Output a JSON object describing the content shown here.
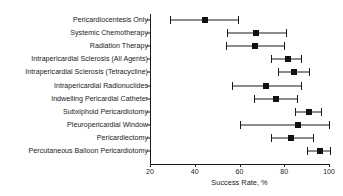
{
  "chart_data": {
    "type": "scatter",
    "subtype": "forest-plot",
    "title": "",
    "xlabel": "Success Rate, %",
    "ylabel": "",
    "xlim": [
      20,
      100
    ],
    "xticks": [
      20,
      40,
      60,
      80,
      100
    ],
    "xticklabels": [
      "20",
      "40",
      "60",
      "80",
      "100"
    ],
    "grid": false,
    "legend": false,
    "marker_style": "filled-square",
    "marker_color": "#111111",
    "line_color": "#1a1a1a",
    "error_bar_style": "capped-horizontal",
    "categories": [
      "Pericardiocentesis Only",
      "Systemic Chemotherapy",
      "Radiation Therapy",
      "Intrapericardial Sclerosis (All Agents)",
      "Intrapericardial Sclerosis (Tetracycline)",
      "Intrapericardial Radionuclides",
      "Indwelling Pericardial Catheter",
      "Subxiphoid Pericardiotomy",
      "Pleuropericardial Window",
      "Pericardiectomy",
      "Percutaneous Balloon Pericardiotomy"
    ],
    "points": [
      {
        "label": "Pericardiocentesis Only",
        "value": 44.5,
        "low": 29.0,
        "high": 59.5
      },
      {
        "label": "Systemic Chemotherapy",
        "value": 67.5,
        "low": 54.5,
        "high": 81.0
      },
      {
        "label": "Radiation Therapy",
        "value": 67.0,
        "low": 54.0,
        "high": 80.0
      },
      {
        "label": "Intrapericardial Sclerosis (All Agents)",
        "value": 81.5,
        "low": 74.0,
        "high": 87.5
      },
      {
        "label": "Intrapericardial Sclerosis (Tetracycline)",
        "value": 84.5,
        "low": 77.0,
        "high": 91.0
      },
      {
        "label": "Intrapericardial Radionuclides",
        "value": 72.0,
        "low": 56.5,
        "high": 87.5
      },
      {
        "label": "Indwelling Pericardial Catheter",
        "value": 76.5,
        "low": 66.5,
        "high": 85.5
      },
      {
        "label": "Subxiphoid Pericardiotomy",
        "value": 91.0,
        "low": 85.0,
        "high": 96.5
      },
      {
        "label": "Pleuropericardial Window",
        "value": 86.0,
        "low": 60.0,
        "high": 100.0
      },
      {
        "label": "Pericardiectomy",
        "value": 83.0,
        "low": 74.0,
        "high": 93.0
      },
      {
        "label": "Percutaneous Balloon Pericardiotomy",
        "value": 96.0,
        "low": 90.0,
        "high": 100.5
      }
    ]
  }
}
